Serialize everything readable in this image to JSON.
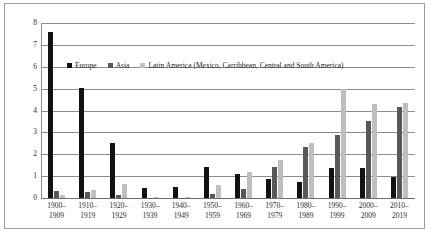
{
  "chart_data": {
    "type": "bar",
    "title": "",
    "subtitle": "",
    "xlabel": "",
    "ylabel": "",
    "ylim": [
      0,
      8
    ],
    "yticks": [
      0,
      1,
      2,
      3,
      4,
      5,
      6,
      7,
      8
    ],
    "ytick_labels": [
      "0",
      "1",
      "2",
      "3",
      "4",
      "5",
      "6",
      "7",
      "8"
    ],
    "grid": true,
    "legend_position": "inside-top-left",
    "categories": [
      "1900–\n1909",
      "1910–\n1919",
      "1920–\n1929",
      "1930–\n1939",
      "1940–\n1949",
      "1950–\n1959",
      "1960–\n1969",
      "1970–\n1979",
      "1980–\n1989",
      "1990–\n1999",
      "2000–\n2009",
      "2010–\n2019"
    ],
    "series": [
      {
        "name": "Europe",
        "color": "#121212",
        "values": [
          7.6,
          5.05,
          2.5,
          0.48,
          0.5,
          1.4,
          1.1,
          0.85,
          0.72,
          1.35,
          1.35,
          0.95
        ]
      },
      {
        "name": "Asia",
        "color": "#585858",
        "values": [
          0.3,
          0.27,
          0.12,
          0.02,
          0.02,
          0.18,
          0.4,
          1.42,
          2.35,
          2.9,
          3.5,
          4.15
        ]
      },
      {
        "name": "Latin America (Mexico, Carribbean, Central and South America)",
        "color": "#bfbfbf",
        "values": [
          0.15,
          0.37,
          0.65,
          0.03,
          0.05,
          0.6,
          1.2,
          1.75,
          2.5,
          5.0,
          4.3,
          4.35
        ]
      }
    ]
  },
  "legend": {
    "entries": [
      {
        "label": "Europe",
        "swatch": "europe"
      },
      {
        "label": "Asia",
        "swatch": "asia"
      },
      {
        "label": "Latin America (Mexico, Carribbean, Central and South America)",
        "swatch": "latin-america"
      }
    ]
  },
  "colors": {
    "europe": "#121212",
    "asia": "#585858",
    "latin_america": "#bfbfbf",
    "gridline": "#8d8d8d",
    "frame": "#9a9a9a",
    "text": "#2a2a2a"
  }
}
